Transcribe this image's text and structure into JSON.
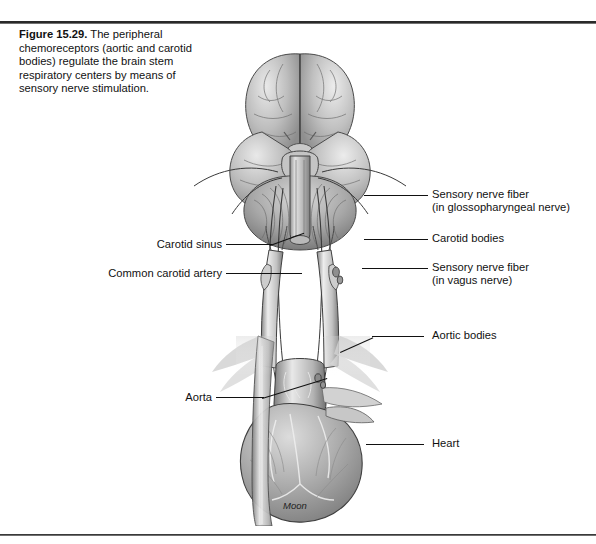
{
  "figure": {
    "number_label": "Figure 15.29.",
    "caption_text": " The peripheral chemoreceptors (aortic and carotid bodies) regulate the brain stem respiratory centers by means of sensory nerve stimulation.",
    "artist_signature": "Moon",
    "page_header_faint": ""
  },
  "illustration": {
    "alt_name": "brain-brainstem-carotid-aorta-heart-illustration",
    "parts": [
      "cerebrum",
      "cerebellum",
      "brain stem",
      "cranial nerves",
      "common carotid arteries",
      "carotid sinus",
      "carotid bodies",
      "aortic arch",
      "aortic bodies",
      "heart",
      "descending aorta"
    ]
  },
  "labels_left": [
    {
      "id": "carotid-sinus",
      "text": "Carotid sinus"
    },
    {
      "id": "common-carotid-artery",
      "text": "Common carotid artery"
    },
    {
      "id": "aorta",
      "text": "Aorta"
    }
  ],
  "labels_right": [
    {
      "id": "sensory-nerve-fiber-glossopharyngeal",
      "line1": "Sensory nerve fiber",
      "line2": "(in glossopharyngeal nerve)"
    },
    {
      "id": "carotid-bodies",
      "line1": "Carotid bodies",
      "line2": ""
    },
    {
      "id": "sensory-nerve-fiber-vagus",
      "line1": "Sensory nerve fiber",
      "line2": "(in vagus nerve)"
    },
    {
      "id": "aortic-bodies",
      "line1": "Aortic bodies",
      "line2": ""
    },
    {
      "id": "heart",
      "line1": "Heart",
      "line2": ""
    }
  ],
  "colors": {
    "ink": "#111111",
    "background": "#ffffff",
    "art_mid": "#9a9a9a",
    "art_dark": "#5a5a5a",
    "art_light": "#d8d8d8"
  }
}
